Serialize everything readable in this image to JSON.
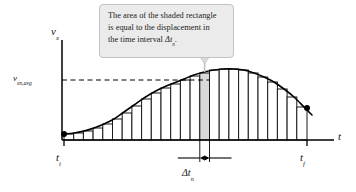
{
  "figure": {
    "type": "velocity-time-graph-riemann-sum",
    "callout": {
      "line1": "The area of the shaded rectangle",
      "line2": "is equal to the displacement in",
      "line3_pre": "the time interval ",
      "line3_sym": "Δt",
      "line3_sub": "n",
      "line3_post": "."
    },
    "axes": {
      "y_label_sym": "v",
      "y_label_sub": "x",
      "x_label_sym": "t",
      "x_tick_initial_sym": "t",
      "x_tick_initial_sub": "i",
      "x_tick_final_sym": "t",
      "x_tick_final_sub": "f"
    },
    "annotations": {
      "avg_velocity_sym": "v",
      "avg_velocity_sub": "xn,avg",
      "interval_sym": "Δt",
      "interval_sub": "n"
    },
    "colors": {
      "curve": "#000000",
      "bar_outline": "#1a1a1a",
      "bar_fill": "#ffffff",
      "shaded_bar_fill": "#d9d9d9",
      "callout_fill": "#ebebeb",
      "callout_border": "#c2c2c2",
      "axis": "#000000",
      "dashed_guide": "#000000",
      "endpoint_dot": "#000000"
    }
  },
  "chart_data": {
    "type": "area",
    "title": "",
    "xlabel": "t",
    "ylabel": "v_x",
    "grid": false,
    "legend": null,
    "axis_origin_px": [
      62,
      140
    ],
    "x_axis_end_px": [
      334,
      140
    ],
    "y_axis_top_px": [
      62,
      40
    ],
    "xlim_labels": [
      "t_i",
      "t_f"
    ],
    "t_i_px": 64,
    "t_f_px": 307,
    "avg_level_px": 80,
    "curve_note": "Smooth bell-shaped v_x(t) curve rising from t_i, peaking near t=0.60 of the interval, falling to t_f. Approximated by narrow rectangles (Riemann sum); one rectangle is shaded gray.",
    "shaded_bar_index": 14,
    "n_bars": 25,
    "curve_points_px": [
      [
        64,
        134
      ],
      [
        74,
        133
      ],
      [
        84,
        131
      ],
      [
        94,
        128
      ],
      [
        104,
        124
      ],
      [
        114,
        119
      ],
      [
        124,
        112
      ],
      [
        134,
        105
      ],
      [
        144,
        98
      ],
      [
        154,
        92
      ],
      [
        164,
        87
      ],
      [
        174,
        83
      ],
      [
        184,
        79
      ],
      [
        194,
        75
      ],
      [
        204,
        72
      ],
      [
        214,
        70
      ],
      [
        224,
        69
      ],
      [
        234,
        69
      ],
      [
        244,
        70
      ],
      [
        254,
        73
      ],
      [
        264,
        77
      ],
      [
        274,
        82
      ],
      [
        284,
        89
      ],
      [
        294,
        97
      ],
      [
        304,
        107
      ],
      [
        312,
        115
      ]
    ],
    "bars": [
      {
        "x": 64,
        "w": 9.7,
        "h_top": 134,
        "shaded": false
      },
      {
        "x": 73.7,
        "w": 9.7,
        "h_top": 133,
        "shaded": false
      },
      {
        "x": 83.4,
        "w": 9.7,
        "h_top": 131,
        "shaded": false
      },
      {
        "x": 93.1,
        "w": 9.7,
        "h_top": 128,
        "shaded": false
      },
      {
        "x": 102.8,
        "w": 9.7,
        "h_top": 124,
        "shaded": false
      },
      {
        "x": 112.5,
        "w": 9.7,
        "h_top": 119,
        "shaded": false
      },
      {
        "x": 122.2,
        "w": 9.7,
        "h_top": 113,
        "shaded": false
      },
      {
        "x": 131.9,
        "w": 9.7,
        "h_top": 106,
        "shaded": false
      },
      {
        "x": 141.6,
        "w": 9.7,
        "h_top": 99,
        "shaded": false
      },
      {
        "x": 151.3,
        "w": 9.7,
        "h_top": 93,
        "shaded": false
      },
      {
        "x": 161,
        "w": 9.7,
        "h_top": 88,
        "shaded": false
      },
      {
        "x": 170.7,
        "w": 9.7,
        "h_top": 84,
        "shaded": false
      },
      {
        "x": 180.4,
        "w": 9.7,
        "h_top": 80,
        "shaded": false
      },
      {
        "x": 190.1,
        "w": 9.7,
        "h_top": 76,
        "shaded": false
      },
      {
        "x": 199.8,
        "w": 9.7,
        "h_top": 73,
        "shaded": true
      },
      {
        "x": 209.5,
        "w": 9.7,
        "h_top": 70,
        "shaded": false
      },
      {
        "x": 219.2,
        "w": 9.7,
        "h_top": 69,
        "shaded": false
      },
      {
        "x": 228.9,
        "w": 9.7,
        "h_top": 69,
        "shaded": false
      },
      {
        "x": 238.6,
        "w": 9.7,
        "h_top": 70,
        "shaded": false
      },
      {
        "x": 248.3,
        "w": 9.7,
        "h_top": 73,
        "shaded": false
      },
      {
        "x": 258,
        "w": 9.7,
        "h_top": 77,
        "shaded": false
      },
      {
        "x": 267.7,
        "w": 9.7,
        "h_top": 82,
        "shaded": false
      },
      {
        "x": 277.4,
        "w": 9.7,
        "h_top": 89,
        "shaded": false
      },
      {
        "x": 287.1,
        "w": 9.7,
        "h_top": 97,
        "shaded": false
      },
      {
        "x": 296.8,
        "w": 10.2,
        "h_top": 107,
        "shaded": false
      }
    ]
  }
}
